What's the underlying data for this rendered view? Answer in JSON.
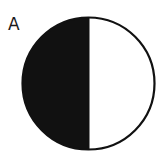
{
  "figure": {
    "panel_label": "A",
    "shape": "half-filled-circle",
    "filled_side": "left",
    "colors": {
      "fill_dark": "#111111",
      "fill_light": "#ffffff",
      "stroke": "#111111"
    }
  }
}
